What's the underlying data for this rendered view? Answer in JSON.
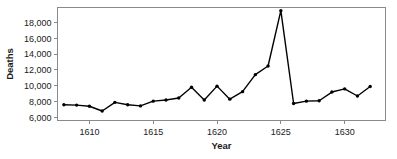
{
  "chart_data": {
    "type": "line",
    "title": "",
    "xlabel": "Year",
    "ylabel": "Deaths",
    "xlim": [
      1607.5,
      1633.2
    ],
    "ylim": [
      5600,
      19900
    ],
    "grid": false,
    "legend": false,
    "legend_position": "none",
    "xticks": [
      1610,
      1615,
      1620,
      1625,
      1630
    ],
    "xtick_labels": [
      "1610",
      "1615",
      "1620",
      "1625",
      "1630"
    ],
    "yticks": [
      6000,
      8000,
      10000,
      12000,
      14000,
      16000,
      18000
    ],
    "ytick_labels": [
      "6,000",
      "8,000",
      "10,000",
      "12,000",
      "14,000",
      "16,000",
      "18,000"
    ],
    "x": [
      1608,
      1609,
      1610,
      1611,
      1612,
      1613,
      1614,
      1615,
      1616,
      1617,
      1618,
      1619,
      1620,
      1621,
      1622,
      1623,
      1624,
      1625,
      1626,
      1627,
      1628,
      1629,
      1630,
      1631,
      1632
    ],
    "values": [
      7600,
      7550,
      7400,
      6800,
      7900,
      7600,
      7450,
      8050,
      8200,
      8450,
      9800,
      8200,
      9950,
      8300,
      9250,
      11400,
      12500,
      19500,
      7750,
      8050,
      8100,
      9200,
      9600,
      8700,
      9900
    ],
    "series": [
      {
        "name": "Deaths",
        "color": "#000000",
        "marker": "dot",
        "values": [
          7600,
          7550,
          7400,
          6800,
          7900,
          7600,
          7450,
          8050,
          8200,
          8450,
          9800,
          8200,
          9950,
          8300,
          9250,
          11400,
          12500,
          19500,
          7750,
          8050,
          8100,
          9200,
          9600,
          8700,
          9900
        ]
      }
    ],
    "annotations": []
  },
  "style": {
    "axis_color": "#8a8a8a",
    "line_color": "#000000",
    "text_color": "#1a1a1a",
    "background": "#ffffff"
  }
}
